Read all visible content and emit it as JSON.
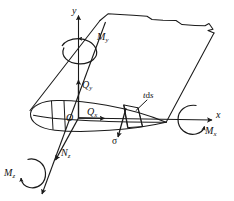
{
  "figure": {
    "stroke_color": "#1a1a1a",
    "background_color": "#ffffff"
  },
  "axes": [
    {
      "id": "y",
      "label": "y",
      "description": "vertical axis pointing up from origin",
      "arrow": true
    },
    {
      "id": "x",
      "label": "x",
      "description": "horizontal axis pointing right from origin",
      "arrow": true
    },
    {
      "id": "z",
      "label": "z",
      "description": "oblique axis pointing down-left out of the plane",
      "arrow": true
    }
  ],
  "forces": [
    {
      "id": "Qy",
      "symbol": "Q",
      "subscript": "y",
      "description": "transverse shear force along y"
    },
    {
      "id": "Qx",
      "symbol": "Q",
      "subscript": "x",
      "description": "transverse shear force along x"
    },
    {
      "id": "Nz",
      "symbol": "N",
      "subscript": "z",
      "description": "axial normal force along z"
    }
  ],
  "moments": [
    {
      "id": "My",
      "symbol": "M",
      "subscript": "y",
      "description": "bending moment about y axis"
    },
    {
      "id": "Mx",
      "symbol": "M",
      "subscript": "x",
      "description": "bending moment about x axis"
    },
    {
      "id": "Mz",
      "symbol": "M",
      "subscript": "z",
      "description": "torsional moment about z axis"
    }
  ],
  "annotations": [
    {
      "id": "origin",
      "label": "O",
      "description": "coordinate system origin at the section centroid"
    },
    {
      "id": "tds",
      "label": "t d s",
      "symbol_italic": "t",
      "symbol_upright": "d",
      "symbol_italic2": "s",
      "description": "wall thickness times arc-length element"
    },
    {
      "id": "sigma",
      "label": "σ",
      "description": "normal stress acting on the wall element"
    }
  ]
}
